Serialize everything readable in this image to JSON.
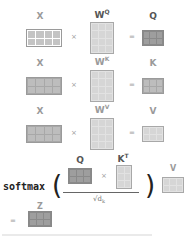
{
  "rows": [
    {
      "input": "X",
      "weight": "W",
      "weight_sup": "Q",
      "output": "Q",
      "times": "×",
      "equals": "="
    },
    {
      "input": "X",
      "weight": "W",
      "weight_sup": "K",
      "output": "K",
      "times": "×",
      "equals": "="
    },
    {
      "input": "X",
      "weight": "W",
      "weight_sup": "V",
      "output": "V",
      "times": "×",
      "equals": "="
    }
  ],
  "attention": {
    "function": "softmax",
    "open_paren": "(",
    "close_paren": ")",
    "numerator_left": "Q",
    "numerator_right": "K",
    "numerator_right_sup": "T",
    "times": "×",
    "denominator": "√d",
    "denominator_sub": "k",
    "value": "V",
    "equals": "=",
    "result": "Z"
  },
  "colors": {
    "input_matrix": "#c4c4c4",
    "weight_matrix": "#d6d6d6",
    "output_matrix": "#9e9e9e",
    "label_gray": "#9a9a9a",
    "label_dark": "#555555"
  }
}
